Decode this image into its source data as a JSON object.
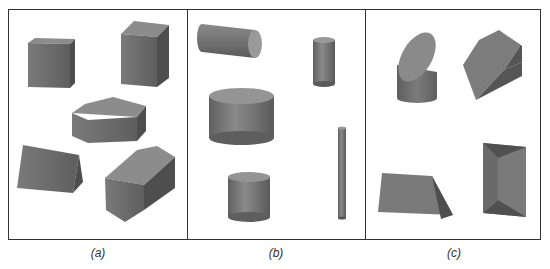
{
  "figure": {
    "panels": [
      {
        "id": "a",
        "label": "(a)",
        "shapes": [
          "cube",
          "rectangular-prism",
          "pentagonal-prism",
          "triangular-prism",
          "hexagonal-prism"
        ]
      },
      {
        "id": "b",
        "label": "(b)",
        "shapes": [
          "horizontal-cylinder",
          "small-cylinder",
          "wide-cylinder",
          "thin-rod-cylinder",
          "short-cylinder"
        ]
      },
      {
        "id": "c",
        "label": "(c)",
        "shapes": [
          "truncated-cylinder",
          "hexagonal-solid",
          "wedge",
          "frustum-prism"
        ]
      }
    ],
    "colors": {
      "border": "#333333",
      "shape_light": "#8a8a8a",
      "shape_mid": "#6e6e6e",
      "shape_dark": "#545454"
    }
  }
}
